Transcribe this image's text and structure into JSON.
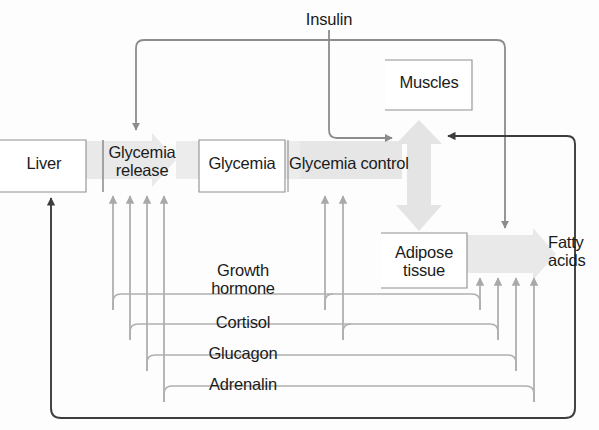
{
  "diagram": {
    "background_color": "#fdfdfd",
    "palette": {
      "band_gray": "#e8e8e8",
      "band_gray_light": "#efefef",
      "arrow_gray": "#a8a8a8",
      "line_dark": "#3d3d3d",
      "line_mid": "#8c8c8c",
      "box_fill": "#ffffff",
      "box_border": "#8f8f8f",
      "text": "#1b1b1b"
    },
    "nodes": [
      {
        "id": "liver",
        "label": "Liver",
        "x": 42,
        "y": 163,
        "type": "box"
      },
      {
        "id": "glycemia-release",
        "label": "Glycemia\nrelease",
        "x": 140,
        "y": 163,
        "type": "box"
      },
      {
        "id": "glycemia",
        "label": "Glycemia",
        "x": 243,
        "y": 163,
        "type": "box"
      },
      {
        "id": "glycemia-control",
        "label": "Glycemia control",
        "x": 350,
        "y": 163,
        "type": "band-label"
      },
      {
        "id": "muscles",
        "label": "Muscles",
        "x": 437,
        "y": 83,
        "type": "box"
      },
      {
        "id": "adipose-tissue",
        "label": "Adipose\ntissue",
        "x": 425,
        "y": 263,
        "type": "box"
      },
      {
        "id": "fatty-acids",
        "label": "Fatty\nacids",
        "x": 574,
        "y": 253,
        "type": "band-label"
      }
    ],
    "hormone_labels": [
      {
        "id": "insulin",
        "label": "Insulin",
        "x": 329,
        "y": 21
      },
      {
        "id": "growth-hormone",
        "label": "Growth\nhormone",
        "x": 243,
        "y": 281
      },
      {
        "id": "cortisol",
        "label": "Cortisol",
        "x": 243,
        "y": 326
      },
      {
        "id": "glucagon",
        "label": "Glucagon",
        "x": 243,
        "y": 357
      },
      {
        "id": "adrenalin",
        "label": "Adrenalin",
        "x": 243,
        "y": 388
      }
    ],
    "edges": [
      {
        "from": "insulin",
        "to": "glycemia-release",
        "style": "mid-gray",
        "note": "inhibits glycemia release"
      },
      {
        "from": "insulin",
        "to": "glycemia-control",
        "style": "mid-gray",
        "note": "to glycemia control via muscles"
      },
      {
        "from": "insulin",
        "to": "fatty-acids",
        "style": "mid-gray",
        "note": "down to adipose / fatty acids band"
      },
      {
        "from": "growth-hormone",
        "to": "glycemia-release",
        "style": "light-gray"
      },
      {
        "from": "growth-hormone",
        "to": "fatty-acids",
        "style": "light-gray"
      },
      {
        "from": "cortisol",
        "to": "glycemia-release",
        "style": "light-gray"
      },
      {
        "from": "cortisol",
        "to": "fatty-acids",
        "style": "light-gray"
      },
      {
        "from": "glucagon",
        "to": "glycemia-release",
        "style": "light-gray"
      },
      {
        "from": "glucagon",
        "to": "fatty-acids",
        "style": "light-gray"
      },
      {
        "from": "adrenalin",
        "to": "glycemia-release",
        "style": "light-gray"
      },
      {
        "from": "adrenalin",
        "to": "fatty-acids",
        "style": "light-gray"
      },
      {
        "from": "growth-hormone",
        "to": "glycemia-control",
        "style": "light-gray"
      },
      {
        "from": "cortisol",
        "to": "glycemia-control",
        "style": "light-gray"
      },
      {
        "from": "fatty-acids",
        "to": "glycemia-control",
        "style": "dark"
      },
      {
        "from": "fatty-acids",
        "to": "liver",
        "style": "dark",
        "note": "bottom feedback loop to liver"
      }
    ]
  }
}
